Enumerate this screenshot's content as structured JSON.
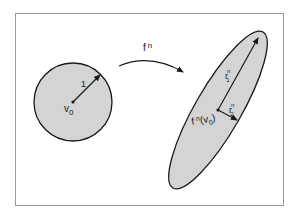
{
  "diagram": {
    "colors": {
      "frame": "#9a9a9a",
      "fill": "#d4d4d4",
      "stroke": "#1a1a1a"
    },
    "circle": {
      "radius_label": "1",
      "center_label": "v",
      "center_sub": "0"
    },
    "map": {
      "label": "f",
      "label_sup": "n"
    },
    "ellipse": {
      "axis1_label": "r",
      "axis1_sup": "n",
      "axis1_sub": "1",
      "axis2_label": "r",
      "axis2_sup": "n",
      "axis2_sub": "2",
      "center_label_f": "f",
      "center_label_sup": "n",
      "center_label_arg": "(v",
      "center_label_sub": "0",
      "center_label_close": ")"
    }
  }
}
